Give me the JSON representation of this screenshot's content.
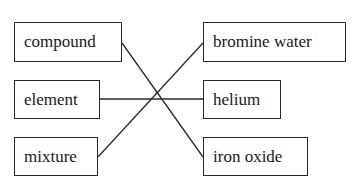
{
  "diagram": {
    "type": "matching",
    "left_items": [
      {
        "label": "compound"
      },
      {
        "label": "element"
      },
      {
        "label": "mixture"
      }
    ],
    "right_items": [
      {
        "label": "bromine water"
      },
      {
        "label": "helium"
      },
      {
        "label": "iron oxide"
      }
    ],
    "connections": [
      {
        "from": "compound",
        "to": "iron oxide"
      },
      {
        "from": "element",
        "to": "helium"
      },
      {
        "from": "mixture",
        "to": "bromine water"
      }
    ],
    "line_color": "#2a2a2a",
    "border_color": "#2a2a2a"
  }
}
